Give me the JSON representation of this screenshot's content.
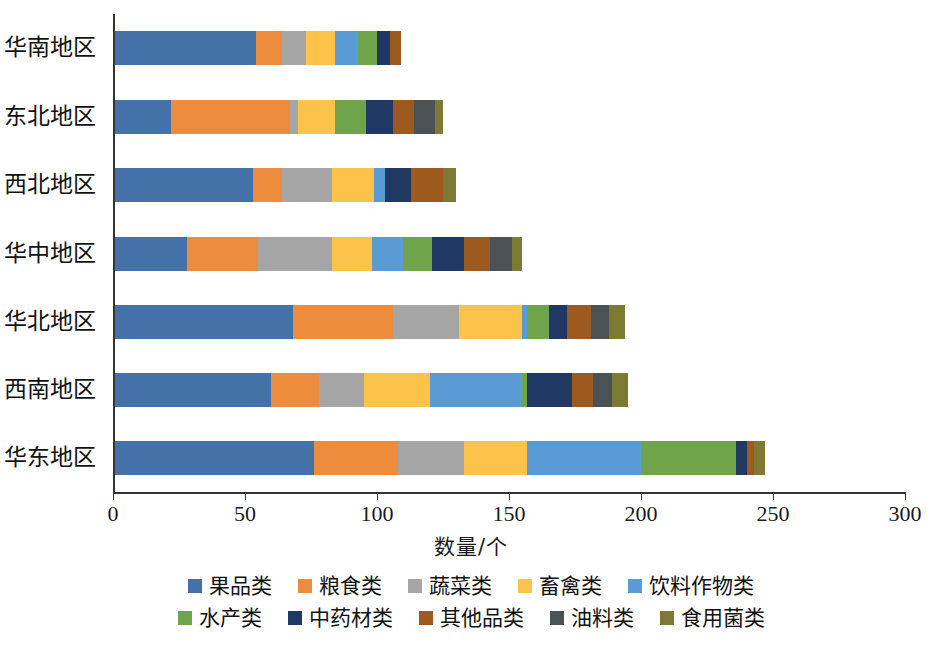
{
  "chart_data": {
    "type": "bar",
    "orientation": "horizontal",
    "stacked": true,
    "title": "",
    "xlabel": "数量/个",
    "ylabel": "",
    "xlim": [
      0,
      300
    ],
    "xticks": [
      0,
      50,
      100,
      150,
      200,
      250,
      300
    ],
    "xtick_labels": [
      "0",
      "50",
      "100",
      "150",
      "200",
      "250",
      "300"
    ],
    "grid": false,
    "legend_position": "bottom",
    "categories": [
      "华南地区",
      "东北地区",
      "西北地区",
      "华中地区",
      "华北地区",
      "西南地区",
      "华东地区"
    ],
    "series": [
      {
        "name": "果品类",
        "color": "#4472a8",
        "values": [
          54,
          22,
          53,
          28,
          68,
          60,
          76
        ]
      },
      {
        "name": "粮食类",
        "color": "#ed8c3c",
        "values": [
          10,
          45,
          11,
          27,
          38,
          18,
          32
        ]
      },
      {
        "name": "蔬菜类",
        "color": "#a5a5a5",
        "values": [
          9,
          3,
          19,
          28,
          25,
          17,
          25
        ]
      },
      {
        "name": "畜禽类",
        "color": "#fbc34a",
        "values": [
          11,
          14,
          16,
          15,
          24,
          25,
          24
        ]
      },
      {
        "name": "饮料作物类",
        "color": "#5b9bd5",
        "values": [
          9,
          0,
          4,
          12,
          2,
          35,
          43
        ]
      },
      {
        "name": "水产类",
        "color": "#70a44b",
        "values": [
          7,
          12,
          0,
          11,
          8,
          2,
          36
        ]
      },
      {
        "name": "中药材类",
        "color": "#1f3864",
        "values": [
          5,
          10,
          10,
          12,
          7,
          17,
          4
        ]
      },
      {
        "name": "其他品类",
        "color": "#9c5a1e",
        "values": [
          4,
          8,
          12,
          10,
          9,
          8,
          3
        ]
      },
      {
        "name": "油料类",
        "color": "#4a5256",
        "values": [
          0,
          8,
          0,
          8,
          7,
          7,
          0
        ]
      },
      {
        "name": "食用菌类",
        "color": "#7d7b33",
        "values": [
          0,
          3,
          5,
          4,
          6,
          6,
          4
        ]
      }
    ],
    "totals": [
      119,
      125,
      130,
      155,
      194,
      195,
      287
    ]
  },
  "legend": {
    "rows": [
      [
        {
          "label": "果品类",
          "color": "#4472a8"
        },
        {
          "label": "粮食类",
          "color": "#ed8c3c"
        },
        {
          "label": "蔬菜类",
          "color": "#a5a5a5"
        },
        {
          "label": "畜禽类",
          "color": "#fbc34a"
        },
        {
          "label": "饮料作物类",
          "color": "#5b9bd5"
        }
      ],
      [
        {
          "label": "水产类",
          "color": "#70a44b"
        },
        {
          "label": "中药材类",
          "color": "#1f3864"
        },
        {
          "label": "其他品类",
          "color": "#9c5a1e"
        },
        {
          "label": "油料类",
          "color": "#4a5256"
        },
        {
          "label": "食用菌类",
          "color": "#7d7b33"
        }
      ]
    ]
  },
  "axis": {
    "x_title": "数量/个"
  }
}
